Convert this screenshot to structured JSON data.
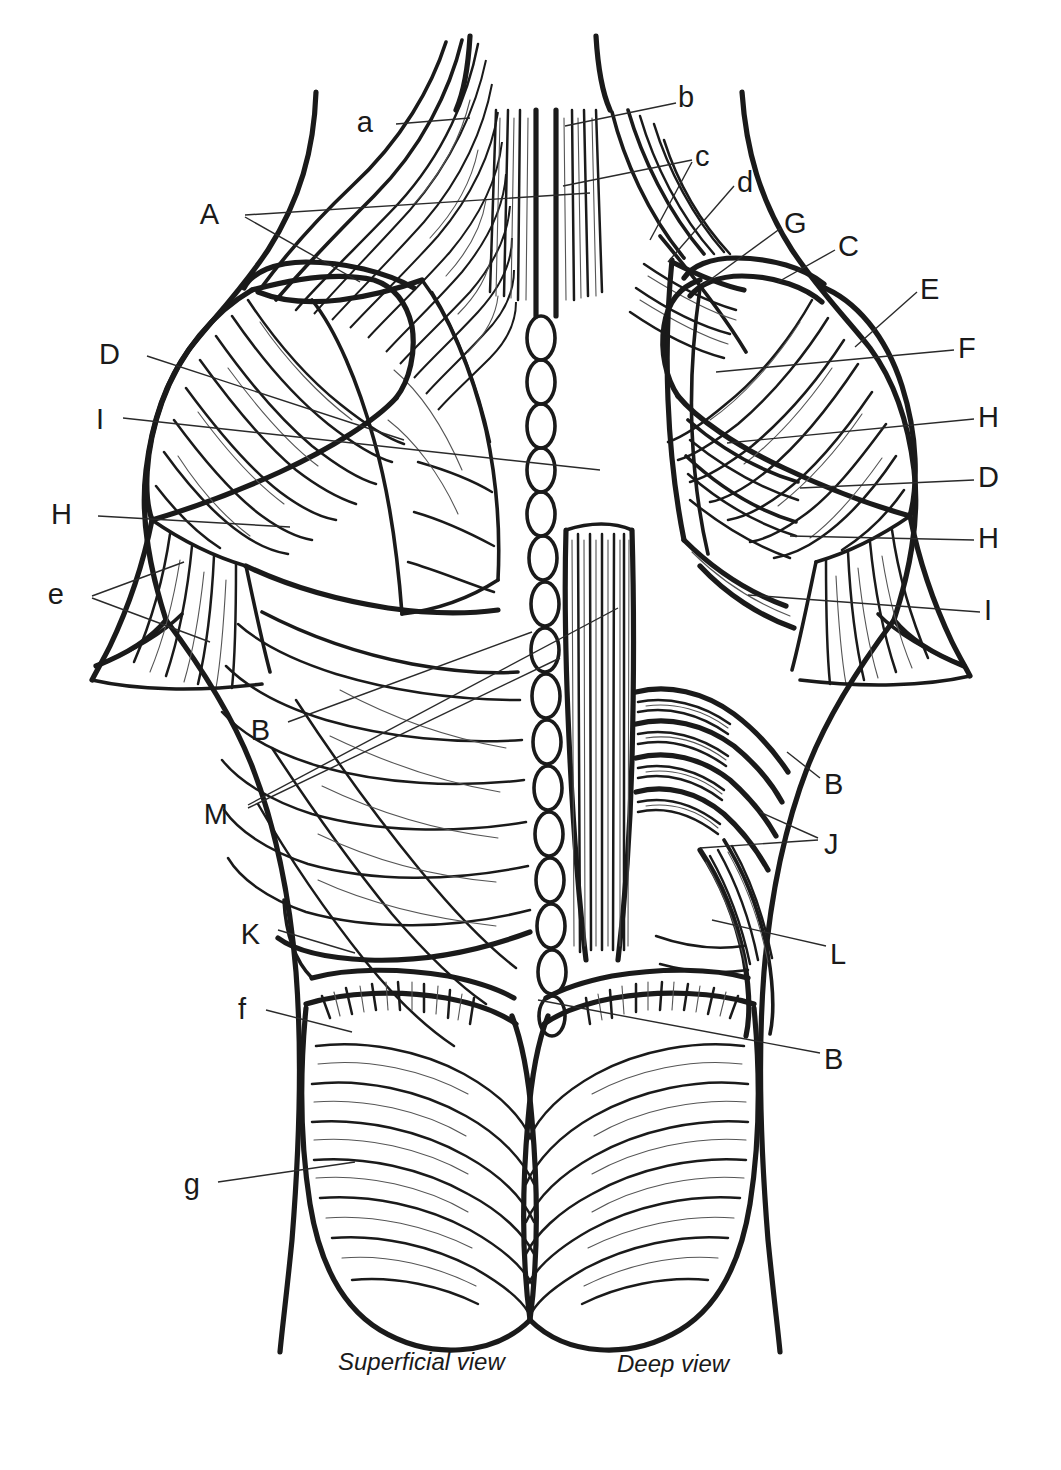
{
  "figure": {
    "style": {
      "ink": "#1a1a1a",
      "background": "#ffffff",
      "leader_stroke": "#2a2a2a",
      "leader_width": 1.4
    },
    "captions": [
      {
        "id": "caption-superficial",
        "text": "Superficial view",
        "x": 338,
        "y": 1348
      },
      {
        "id": "caption-deep",
        "text": "Deep view",
        "x": 617,
        "y": 1350
      }
    ],
    "labels": [
      {
        "id": "label-a",
        "text": "a",
        "x": 373,
        "y": 108,
        "anchor": "end",
        "leaders": [
          [
            [
              396,
              124
            ],
            [
              470,
              118
            ]
          ]
        ]
      },
      {
        "id": "label-b",
        "text": "b",
        "x": 678,
        "y": 83,
        "anchor": "start",
        "leaders": [
          [
            [
              676,
              103
            ],
            [
              565,
              126
            ]
          ]
        ]
      },
      {
        "id": "label-A",
        "text": "A",
        "x": 219,
        "y": 200,
        "anchor": "end",
        "leaders": [
          [
            [
              245,
              215
            ],
            [
              590,
              193
            ]
          ],
          [
            [
              245,
              217
            ],
            [
              360,
              282
            ]
          ]
        ]
      },
      {
        "id": "label-c",
        "text": "c",
        "x": 695,
        "y": 142,
        "anchor": "start",
        "leaders": [
          [
            [
              692,
              160
            ],
            [
              563,
              186
            ]
          ],
          [
            [
              692,
              162
            ],
            [
              650,
              240
            ]
          ]
        ]
      },
      {
        "id": "label-d",
        "text": "d",
        "x": 737,
        "y": 168,
        "anchor": "start",
        "leaders": [
          [
            [
              734,
              186
            ],
            [
              668,
              262
            ]
          ]
        ]
      },
      {
        "id": "label-G",
        "text": "G",
        "x": 784,
        "y": 209,
        "anchor": "start",
        "leaders": [
          [
            [
              781,
              228
            ],
            [
              703,
              285
            ]
          ]
        ]
      },
      {
        "id": "label-C",
        "text": "C",
        "x": 838,
        "y": 232,
        "anchor": "start",
        "leaders": [
          [
            [
              835,
              250
            ],
            [
              778,
              282
            ]
          ]
        ]
      },
      {
        "id": "label-E",
        "text": "E",
        "x": 920,
        "y": 275,
        "anchor": "start",
        "leaders": [
          [
            [
              917,
              292
            ],
            [
              855,
              347
            ]
          ]
        ]
      },
      {
        "id": "label-F",
        "text": "F",
        "x": 958,
        "y": 334,
        "anchor": "start",
        "leaders": [
          [
            [
              954,
              350
            ],
            [
              716,
              372
            ]
          ]
        ]
      },
      {
        "id": "label-D-left",
        "text": "D",
        "x": 120,
        "y": 340,
        "anchor": "end",
        "leaders": [
          [
            [
              147,
              356
            ],
            [
              404,
              440
            ]
          ]
        ]
      },
      {
        "id": "label-I-left",
        "text": "I",
        "x": 104,
        "y": 405,
        "anchor": "end",
        "leaders": [
          [
            [
              123,
              418
            ],
            [
              600,
              470
            ]
          ]
        ]
      },
      {
        "id": "label-H-right1",
        "text": "H",
        "x": 978,
        "y": 403,
        "anchor": "start",
        "leaders": [
          [
            [
              974,
              419
            ],
            [
              727,
              443
            ]
          ]
        ]
      },
      {
        "id": "label-D-right",
        "text": "D",
        "x": 978,
        "y": 463,
        "anchor": "start",
        "leaders": [
          [
            [
              974,
              480
            ],
            [
              800,
              488
            ]
          ]
        ]
      },
      {
        "id": "label-H-left",
        "text": "H",
        "x": 72,
        "y": 500,
        "anchor": "end",
        "leaders": [
          [
            [
              98,
              516
            ],
            [
              290,
              527
            ]
          ]
        ]
      },
      {
        "id": "label-H-right2",
        "text": "H",
        "x": 978,
        "y": 524,
        "anchor": "start",
        "leaders": [
          [
            [
              974,
              540
            ],
            [
              790,
              536
            ]
          ]
        ]
      },
      {
        "id": "label-e",
        "text": "e",
        "x": 64,
        "y": 580,
        "anchor": "end",
        "leaders": [
          [
            [
              92,
              596
            ],
            [
              184,
              562
            ]
          ],
          [
            [
              92,
              598
            ],
            [
              210,
              642
            ]
          ]
        ]
      },
      {
        "id": "label-I-right",
        "text": "I",
        "x": 984,
        "y": 596,
        "anchor": "start",
        "leaders": [
          [
            [
              980,
              612
            ],
            [
              748,
              595
            ]
          ]
        ]
      },
      {
        "id": "label-B-left",
        "text": "B",
        "x": 270,
        "y": 716,
        "anchor": "end",
        "leaders": [
          [
            [
              288,
              722
            ],
            [
              532,
              632
            ]
          ]
        ]
      },
      {
        "id": "label-B-right",
        "text": "B",
        "x": 824,
        "y": 770,
        "anchor": "start",
        "leaders": [
          [
            [
              820,
              778
            ],
            [
              787,
              752
            ]
          ]
        ]
      },
      {
        "id": "label-M",
        "text": "M",
        "x": 228,
        "y": 800,
        "anchor": "end",
        "leaders": [
          [
            [
              248,
              805
            ],
            [
              618,
              608
            ]
          ],
          [
            [
              248,
              808
            ],
            [
              560,
              658
            ]
          ]
        ]
      },
      {
        "id": "label-J",
        "text": "J",
        "x": 824,
        "y": 830,
        "anchor": "start",
        "leaders": [
          [
            [
              818,
              838
            ],
            [
              760,
              812
            ]
          ],
          [
            [
              818,
              840
            ],
            [
              700,
              848
            ]
          ]
        ]
      },
      {
        "id": "label-K",
        "text": "K",
        "x": 260,
        "y": 920,
        "anchor": "end",
        "leaders": [
          [
            [
              278,
              930
            ],
            [
              355,
              953
            ]
          ]
        ]
      },
      {
        "id": "label-L",
        "text": "L",
        "x": 830,
        "y": 940,
        "anchor": "start",
        "leaders": [
          [
            [
              826,
              946
            ],
            [
              712,
              920
            ]
          ]
        ]
      },
      {
        "id": "label-f",
        "text": "f",
        "x": 246,
        "y": 995,
        "anchor": "end",
        "leaders": [
          [
            [
              266,
              1010
            ],
            [
              352,
              1032
            ]
          ]
        ]
      },
      {
        "id": "label-B-bottom",
        "text": "B",
        "x": 824,
        "y": 1045,
        "anchor": "start",
        "leaders": [
          [
            [
              820,
              1053
            ],
            [
              538,
              1000
            ]
          ]
        ]
      },
      {
        "id": "label-g",
        "text": "g",
        "x": 200,
        "y": 1170,
        "anchor": "end",
        "leaders": [
          [
            [
              218,
              1182
            ],
            [
              355,
              1162
            ]
          ]
        ]
      }
    ]
  },
  "legend_keys": {
    "uppercase": [
      "A",
      "B",
      "C",
      "D",
      "E",
      "F",
      "G",
      "H",
      "I",
      "J",
      "K",
      "L",
      "M"
    ],
    "lowercase": [
      "a",
      "b",
      "c",
      "d",
      "e",
      "f",
      "g"
    ]
  }
}
